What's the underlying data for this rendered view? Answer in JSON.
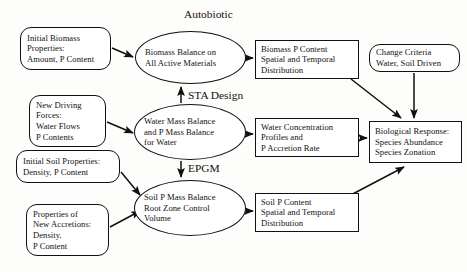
{
  "diagram": {
    "background_color": "#fdfdfb",
    "line_color": "#111111",
    "free_labels": {
      "autobiotic": "Autobiotic",
      "sta_design": "STA Design",
      "epgm": "EPGM"
    },
    "nodes": {
      "initial_biomass": {
        "shape": "rounded-rect",
        "lines": [
          "Initial Biomass",
          "Properties:",
          "Amount, P Content"
        ]
      },
      "new_driving_forces": {
        "shape": "rounded-rect",
        "lines": [
          "New Driving",
          "Forces:",
          "Water Flows",
          "P Contents"
        ]
      },
      "initial_soil_properties": {
        "shape": "rounded-rect",
        "lines": [
          "Initial Soil Properties:",
          "Density, P Content"
        ]
      },
      "new_accretions": {
        "shape": "rounded-rect",
        "lines": [
          "Properties of",
          "New Accretions:",
          "Density,",
          "P Content"
        ]
      },
      "biomass_balance": {
        "shape": "ellipse",
        "lines": [
          "Biomass Balance on",
          "All Active Materials"
        ]
      },
      "water_mass_balance": {
        "shape": "ellipse",
        "lines": [
          "Water Mass Balance",
          "and P Mass Balance",
          "for Water"
        ]
      },
      "soil_p_mass_balance": {
        "shape": "ellipse",
        "lines": [
          "Soil P Mass Balance",
          "Root Zone Control",
          "Volume"
        ]
      },
      "biomass_p_content": {
        "shape": "rect",
        "lines": [
          "Biomass P Content",
          "Spatial and Temporal",
          "Distribution"
        ]
      },
      "water_concentration": {
        "shape": "rect",
        "lines": [
          "Water Concentration",
          "Profiles and",
          " P Accretion Rate"
        ]
      },
      "soil_p_content": {
        "shape": "rect",
        "lines": [
          "Soil P Content",
          "Spatial and Temporal",
          "Distribution"
        ]
      },
      "change_criteria": {
        "shape": "rounded-rect",
        "lines": [
          "Change Criteria",
          "Water, Soil Driven"
        ]
      },
      "biological_response": {
        "shape": "rect",
        "lines": [
          "Biological Response:",
          "Species Abundance",
          "Species Zonation"
        ]
      }
    },
    "edges": [
      {
        "from": "initial_biomass",
        "to": "biomass_balance"
      },
      {
        "from": "new_driving_forces",
        "to": "water_mass_balance"
      },
      {
        "from": "initial_soil_properties",
        "to": "soil_p_mass_balance"
      },
      {
        "from": "new_accretions",
        "to": "soil_p_mass_balance"
      },
      {
        "from": "water_mass_balance",
        "to": "biomass_balance",
        "label": "STA Design"
      },
      {
        "from": "water_mass_balance",
        "to": "soil_p_mass_balance",
        "label": "EPGM"
      },
      {
        "from": "biomass_balance",
        "to": "biomass_p_content"
      },
      {
        "from": "water_mass_balance",
        "to": "water_concentration"
      },
      {
        "from": "soil_p_mass_balance",
        "to": "soil_p_content"
      },
      {
        "from": "biomass_p_content",
        "to": "biological_response"
      },
      {
        "from": "water_concentration",
        "to": "biological_response"
      },
      {
        "from": "soil_p_content",
        "to": "biological_response"
      },
      {
        "from": "change_criteria",
        "to": "biological_response"
      }
    ]
  }
}
